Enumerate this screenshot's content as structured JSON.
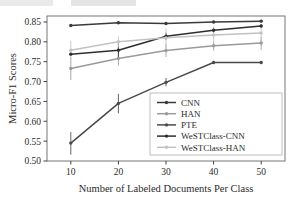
{
  "chart_data": {
    "type": "line",
    "title": "",
    "xlabel": "Number of Labeled Documents Per Class",
    "ylabel": "Micro-F1 Scores",
    "x": [
      10,
      20,
      30,
      40,
      50
    ],
    "xticklabels": [
      "10",
      "20",
      "30",
      "40",
      "50"
    ],
    "yticklabels": [
      "0.50",
      "0.55",
      "0.60",
      "0.65",
      "0.70",
      "0.75",
      "0.80",
      "0.85"
    ],
    "yticks": [
      0.5,
      0.55,
      0.6,
      0.65,
      0.7,
      0.75,
      0.8,
      0.85
    ],
    "xlim": [
      5,
      55
    ],
    "ylim": [
      0.5,
      0.865
    ],
    "grid": false,
    "legend_position": "lower right",
    "series": [
      {
        "name": "CNN",
        "color": "#3a3a3a",
        "marker": "dot",
        "values": [
          0.841,
          0.848,
          0.846,
          0.85,
          0.852
        ],
        "err_low": [
          0.841,
          0.845,
          0.843,
          0.847,
          0.849
        ],
        "err_high": [
          0.843,
          0.851,
          0.849,
          0.853,
          0.855
        ]
      },
      {
        "name": "HAN",
        "color": "#9a9a9a",
        "marker": "dot",
        "values": [
          0.733,
          0.758,
          0.778,
          0.79,
          0.797
        ],
        "err_low": [
          0.704,
          0.74,
          0.762,
          0.778,
          0.78
        ],
        "err_high": [
          0.762,
          0.776,
          0.794,
          0.801,
          0.812
        ]
      },
      {
        "name": "PTE",
        "color": "#4a4a4a",
        "marker": "dot",
        "values": [
          0.545,
          0.645,
          0.698,
          0.748,
          0.748
        ],
        "err_low": [
          0.516,
          0.62,
          0.688,
          0.744,
          0.744
        ],
        "err_high": [
          0.573,
          0.669,
          0.709,
          0.752,
          0.752
        ]
      },
      {
        "name": "WeSTClass-CNN",
        "color": "#2e2e2e",
        "marker": "dot",
        "values": [
          0.769,
          0.779,
          0.814,
          0.829,
          0.84
        ],
        "err_low": [
          0.766,
          0.759,
          0.805,
          0.823,
          0.836
        ],
        "err_high": [
          0.772,
          0.798,
          0.823,
          0.835,
          0.844
        ]
      },
      {
        "name": "WeSTClass-HAN",
        "color": "#c2c2c2",
        "marker": "dot",
        "values": [
          0.779,
          0.8,
          0.81,
          0.817,
          0.822
        ],
        "err_low": [
          0.755,
          0.786,
          0.786,
          0.795,
          0.8
        ],
        "err_high": [
          0.803,
          0.814,
          0.834,
          0.839,
          0.844
        ]
      }
    ]
  },
  "colors": {
    "axis": "#444444",
    "frame": "#777777",
    "background": "#ffffff",
    "legend_border": "#bdbdbd"
  }
}
